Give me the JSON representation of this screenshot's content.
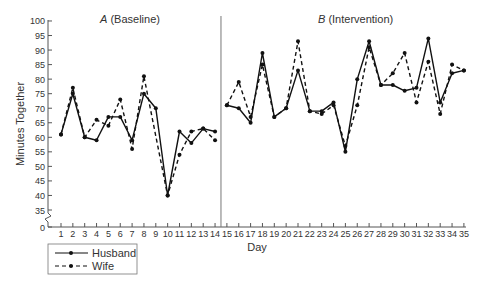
{
  "chart_data": {
    "type": "line",
    "title": "",
    "xlabel": "Day",
    "ylabel": "Minutes Together",
    "ylim": [
      0,
      100
    ],
    "y_axis_break": "between 0 and 35",
    "yticks": [
      0,
      35,
      40,
      45,
      50,
      55,
      60,
      65,
      70,
      75,
      80,
      85,
      90,
      95,
      100
    ],
    "x": [
      1,
      2,
      3,
      4,
      5,
      6,
      7,
      8,
      9,
      10,
      11,
      12,
      13,
      14,
      15,
      16,
      17,
      18,
      19,
      20,
      21,
      22,
      23,
      24,
      25,
      26,
      27,
      28,
      29,
      30,
      31,
      32,
      33,
      34,
      35
    ],
    "phases": [
      {
        "label_italic": "A",
        "label_rest": " (Baseline)",
        "days": [
          1,
          14
        ]
      },
      {
        "label_italic": "B",
        "label_rest": " (Intervention)",
        "days": [
          15,
          35
        ]
      }
    ],
    "phase_change_after_day": 14,
    "series": [
      {
        "name": "Husband",
        "style": "solid",
        "values": [
          61,
          75,
          60,
          59,
          67,
          67,
          59,
          75,
          70,
          40,
          62,
          58,
          63,
          62,
          71,
          70,
          65,
          89,
          67,
          70,
          83,
          69,
          69,
          72,
          55,
          80,
          93,
          78,
          78,
          76,
          77,
          94,
          72,
          82,
          83
        ]
      },
      {
        "name": "Wife",
        "style": "dashed",
        "values": [
          61,
          77,
          60,
          66,
          64,
          73,
          56,
          81,
          null,
          40,
          54,
          62,
          63,
          59,
          71,
          79,
          67,
          85,
          67,
          70,
          93,
          69,
          68,
          71,
          57,
          71,
          91,
          78,
          82,
          89,
          72,
          86,
          68,
          85,
          83
        ]
      }
    ],
    "grid": false,
    "legend_position": "bottom-left"
  },
  "legend": {
    "items": [
      {
        "label": "Husband"
      },
      {
        "label": "Wife"
      }
    ]
  },
  "axes": {
    "xlabel": "Day",
    "ylabel": "Minutes Together"
  }
}
